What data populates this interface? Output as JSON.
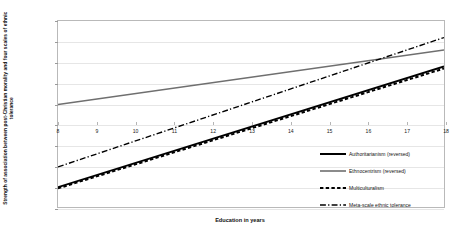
{
  "chart_data": {
    "type": "line",
    "title": "",
    "xlabel": "Education in years",
    "ylabel": "Strength of association between post-Christian morality and four scales of ethnic tolerance",
    "xlim": [
      8,
      18
    ],
    "ylim": [
      -0.2,
      0.25
    ],
    "xticks": [
      "8",
      "9",
      "10",
      "11",
      "12",
      "13",
      "14",
      "15",
      "16",
      "17",
      "18"
    ],
    "yticks": [
      "0.25",
      "0.2",
      "0.15",
      "0.1",
      "0.05",
      "0",
      "-0.05",
      "-0.1",
      "-0.15",
      "-0.2"
    ],
    "ytick_values": [
      0.25,
      0.2,
      0.15,
      0.1,
      0.05,
      0,
      -0.05,
      -0.1,
      -0.15,
      -0.2
    ],
    "grid": true,
    "legend_position": "inside lower-right",
    "x": [
      8,
      18
    ],
    "series": [
      {
        "name": "Authoritarianism (reversed)",
        "values": [
          -0.152,
          0.14
        ],
        "color": "#000000",
        "style": "solid",
        "width": 2.0
      },
      {
        "name": "Ethnocentrism (reversed)",
        "values": [
          0.048,
          0.18
        ],
        "color": "#6f6f6f",
        "style": "solid",
        "width": 1.6
      },
      {
        "name": "Multiculturalism",
        "values": [
          -0.155,
          0.135
        ],
        "color": "#000000",
        "style": "dashed",
        "width": 2.0
      },
      {
        "name": "Meta-scale ethnic tolerance",
        "values": [
          -0.103,
          0.21
        ],
        "color": "#000000",
        "style": "dashdot",
        "width": 1.4
      }
    ]
  },
  "axis": {
    "y_title": "Strength of association between post-Christian morality and four scales of ethnic tolerance",
    "x_title": "Education in years"
  },
  "legend": {
    "items": [
      {
        "label": "Authoritarianism (reversed)",
        "swatch": "solid-thick-black"
      },
      {
        "label": "Ethnocentrism (reversed)",
        "swatch": "solid-thin-gray"
      },
      {
        "label": "Multiculturalism",
        "swatch": "dashed-black"
      },
      {
        "label": "Meta-scale ethnic tolerance",
        "swatch": "dashdot-black"
      }
    ]
  }
}
